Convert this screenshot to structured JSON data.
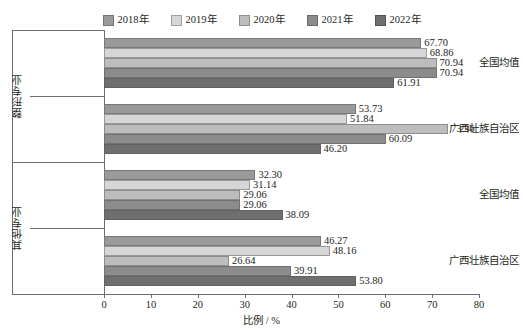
{
  "chart_data": {
    "type": "bar",
    "orientation": "horizontal",
    "title": "",
    "xlabel": "比例 / %",
    "ylabel": "",
    "xlim": [
      0,
      80
    ],
    "xticks": [
      0,
      10,
      20,
      30,
      40,
      50,
      60,
      70,
      80
    ],
    "grid": false,
    "legend_position": "top-center",
    "legend": [
      "2018年",
      "2019年",
      "2020年",
      "2021年",
      "2022年"
    ],
    "groups": [
      {
        "group_label": "整形专业",
        "categories": [
          "全国均值",
          "广西壮族自治区"
        ]
      },
      {
        "group_label": "其他专业",
        "categories": [
          "全国均值",
          "广西壮族自治区"
        ]
      }
    ],
    "categories": [
      "整形专业 / 全国均值",
      "整形专业 / 广西壮族自治区",
      "其他专业 / 全国均值",
      "其他专业 / 广西壮族自治区"
    ],
    "series": [
      {
        "name": "2018年",
        "color": "#9a9a9a",
        "values": [
          67.7,
          53.73,
          32.3,
          46.27
        ]
      },
      {
        "name": "2019年",
        "color": "#d6d6d6",
        "values": [
          68.86,
          51.84,
          31.14,
          48.16
        ]
      },
      {
        "name": "2020年",
        "color": "#bdbdbd",
        "values": [
          70.94,
          73.36,
          29.06,
          26.64
        ]
      },
      {
        "name": "2021年",
        "color": "#8c8c8c",
        "values": [
          70.94,
          60.09,
          29.06,
          39.91
        ]
      },
      {
        "name": "2022年",
        "color": "#6f6f6f",
        "values": [
          61.91,
          46.2,
          38.09,
          53.8
        ]
      }
    ],
    "value_labels": [
      [
        "67.70",
        "68.86",
        "70.94",
        "70.94",
        "61.91"
      ],
      [
        "53.73",
        "51.84",
        "73.36",
        "60.09",
        "46.20"
      ],
      [
        "32.30",
        "31.14",
        "29.06",
        "29.06",
        "38.09"
      ],
      [
        "46.27",
        "48.16",
        "26.64",
        "39.91",
        "53.80"
      ]
    ],
    "axis_color": "#6d6e71"
  }
}
